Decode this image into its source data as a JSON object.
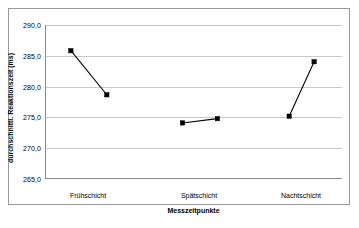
{
  "chart_data": {
    "type": "line",
    "title": "",
    "xlabel": "Messzeitpunkte",
    "ylabel": "durchschnittl. Reaktionszeit (ms)",
    "ylim": [
      265.0,
      290.0
    ],
    "ytick_labels": [
      "290,0",
      "285,0",
      "280,0",
      "275,0",
      "270,0",
      "265,0"
    ],
    "ytick_values": [
      290.0,
      285.0,
      280.0,
      275.0,
      270.0,
      265.0
    ],
    "grid": true,
    "legend": "none",
    "categories": [
      "Frühschicht",
      "Spätschicht",
      "Nachtschicht"
    ],
    "series": [
      {
        "name": "Reaktionszeit",
        "points": [
          {
            "group": "Frühschicht",
            "index": 1,
            "value": 285.8
          },
          {
            "group": "Frühschicht",
            "index": 2,
            "value": 278.6
          },
          {
            "group": "Spätschicht",
            "index": 1,
            "value": 274.0
          },
          {
            "group": "Spätschicht",
            "index": 2,
            "value": 274.7
          },
          {
            "group": "Nachtschicht",
            "index": 1,
            "value": 275.1
          },
          {
            "group": "Nachtschicht",
            "index": 2,
            "value": 284.0
          }
        ]
      }
    ],
    "segments": [
      [
        0,
        1
      ],
      [
        2,
        3
      ],
      [
        4,
        5
      ]
    ],
    "point_x_positions": [
      69,
      105,
      181,
      216,
      288,
      313
    ],
    "category_x_positions": [
      87,
      198,
      300
    ],
    "colors": {
      "marker": "#000000",
      "line": "#000000",
      "gridline": "#c9c9c9",
      "axis": "#8c8c8c",
      "frame": "#9a9a9a",
      "background": "#ffffff",
      "text": "#000000"
    }
  }
}
